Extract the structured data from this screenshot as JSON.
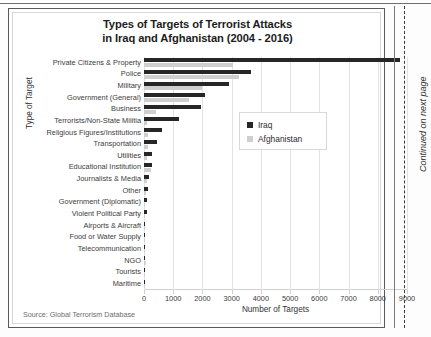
{
  "page": {
    "margin_note": "Continued on next page"
  },
  "chart": {
    "title_line1": "Types of Targets of Terrorist Attacks",
    "title_line2": "in Iraq and Afghanistan (2004 - 2016)",
    "source": "Source: Global Terrorism Database",
    "legend": [
      {
        "label": "Iraq",
        "color": "#262626"
      },
      {
        "label": "Afghanistan",
        "color": "#cfcfcf"
      }
    ]
  },
  "chart_data": {
    "type": "bar",
    "orientation": "horizontal",
    "title": "Types of Targets of Terrorist Attacks in Iraq and Afghanistan (2004 - 2016)",
    "xlabel": "Number of Targets",
    "ylabel": "Type of Target",
    "xlim": [
      0,
      9000
    ],
    "xticks": [
      0,
      1000,
      2000,
      3000,
      4000,
      5000,
      6000,
      7000,
      8000,
      9000
    ],
    "xtick_labels": [
      "0",
      "1000",
      "2000",
      "3000",
      "4000",
      "5000",
      "6000",
      "7000",
      "8000",
      "9000"
    ],
    "grid": "vertical",
    "legend_position": "center-right",
    "categories": [
      "Private Citizens & Property",
      "Police",
      "Military",
      "Government (General)",
      "Business",
      "Terrorists/Non-State Militia",
      "Religious Figures/Institutions",
      "Transportation",
      "Utilities",
      "Educational Institution",
      "Journalists & Media",
      "Other",
      "Government (Diplomatic)",
      "Violent Political Party",
      "Airports & Aircraft",
      "Food or Water Supply",
      "Telecommunication",
      "NGO",
      "Tourists",
      "Maritime"
    ],
    "series": [
      {
        "name": "Iraq",
        "color": "#262626",
        "values": [
          8750,
          3650,
          2900,
          2100,
          1950,
          1200,
          620,
          430,
          290,
          290,
          160,
          120,
          110,
          90,
          40,
          30,
          25,
          20,
          10,
          5
        ]
      },
      {
        "name": "Afghanistan",
        "color": "#cfcfcf",
        "values": [
          3050,
          3250,
          2000,
          1550,
          400,
          90,
          150,
          120,
          90,
          240,
          110,
          60,
          40,
          30,
          25,
          40,
          45,
          60,
          15,
          5
        ]
      }
    ]
  }
}
